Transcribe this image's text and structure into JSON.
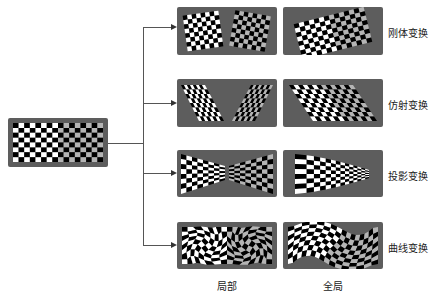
{
  "diagram": {
    "source_label": "original-checkerboard",
    "rows": [
      {
        "label": "刚体变换",
        "type": "rigid"
      },
      {
        "label": "仿射变换",
        "type": "affine"
      },
      {
        "label": "投影变换",
        "type": "projective"
      },
      {
        "label": "曲线变换",
        "type": "curved"
      }
    ],
    "columns": [
      {
        "label": "局部"
      },
      {
        "label": "全局"
      }
    ],
    "colors": {
      "panel_bg": "#5d5d5d",
      "dark_square": "#000000",
      "light_square": "#ffffff",
      "gray_square": "#b4b4b4",
      "connector": "#555555"
    }
  }
}
